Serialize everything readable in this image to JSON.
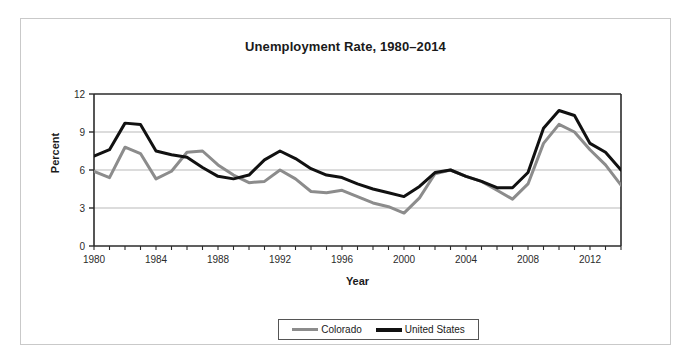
{
  "chart_data": {
    "type": "line",
    "title": "Unemployment Rate, 1980–2014",
    "xlabel": "Year",
    "ylabel": "Percent",
    "xlim": [
      1980,
      2014
    ],
    "ylim": [
      0,
      12
    ],
    "yticks": [
      0,
      3,
      6,
      9,
      12
    ],
    "ytick_labels": [
      "0",
      "3",
      "6",
      "9",
      "12"
    ],
    "xticks": [
      1980,
      1984,
      1988,
      1992,
      1996,
      2000,
      2004,
      2008,
      2012
    ],
    "xtick_labels": [
      "1980",
      "1984",
      "1988",
      "1992",
      "1996",
      "2000",
      "2004",
      "2008",
      "2012"
    ],
    "grid": "horizontal",
    "legend_position": "bottom",
    "x": [
      1980,
      1981,
      1982,
      1983,
      1984,
      1985,
      1986,
      1987,
      1988,
      1989,
      1990,
      1991,
      1992,
      1993,
      1994,
      1995,
      1996,
      1997,
      1998,
      1999,
      2000,
      2001,
      2002,
      2003,
      2004,
      2005,
      2006,
      2007,
      2008,
      2009,
      2010,
      2011,
      2012,
      2013,
      2014
    ],
    "series": [
      {
        "name": "Colorado",
        "color": "#8c8c8c",
        "width": 3,
        "values": [
          5.9,
          5.4,
          7.8,
          7.3,
          5.3,
          5.9,
          7.4,
          7.5,
          6.4,
          5.6,
          5.0,
          5.1,
          6.0,
          5.3,
          4.3,
          4.2,
          4.4,
          3.9,
          3.4,
          3.1,
          2.6,
          3.8,
          5.7,
          6.0,
          5.5,
          5.1,
          4.4,
          3.7,
          4.9,
          8.1,
          9.6,
          9.0,
          7.6,
          6.4,
          4.8
        ]
      },
      {
        "name": "United States",
        "color": "#111111",
        "width": 3,
        "values": [
          7.1,
          7.6,
          9.7,
          9.6,
          7.5,
          7.2,
          7.0,
          6.2,
          5.5,
          5.3,
          5.6,
          6.8,
          7.5,
          6.9,
          6.1,
          5.6,
          5.4,
          4.9,
          4.5,
          4.2,
          3.9,
          4.7,
          5.8,
          6.0,
          5.5,
          5.1,
          4.6,
          4.6,
          5.8,
          9.3,
          10.7,
          10.3,
          8.1,
          7.4,
          6.0
        ]
      }
    ]
  },
  "legend": {
    "entries": [
      {
        "label": "Colorado"
      },
      {
        "label": "United States"
      }
    ]
  }
}
